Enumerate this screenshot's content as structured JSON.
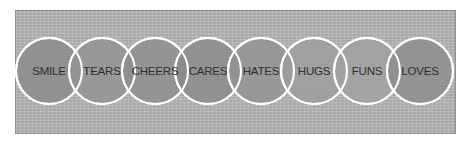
{
  "diagram": {
    "type": "overlapping-circles-row",
    "circles": [
      {
        "label": "SMILE",
        "fill": "#8a8a8a"
      },
      {
        "label": "TEARS",
        "fill": "#929292"
      },
      {
        "label": "CHEERS",
        "fill": "#8e8e8e"
      },
      {
        "label": "CARES",
        "fill": "#8a8a8a"
      },
      {
        "label": "HATES",
        "fill": "#939393"
      },
      {
        "label": "HUGS",
        "fill": "#9c9c9c"
      },
      {
        "label": "FUNS",
        "fill": "#a0a0a0"
      },
      {
        "label": "LOVES",
        "fill": "#8c8c8c"
      }
    ],
    "outline_color": "#ffffff",
    "background_color": "#b4b4b4"
  }
}
